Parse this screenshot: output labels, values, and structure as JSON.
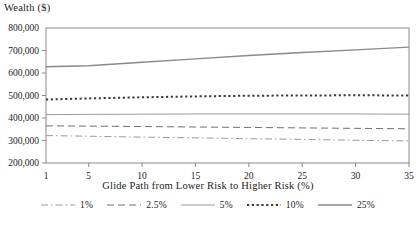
{
  "chart_data": {
    "type": "line",
    "title": "",
    "ylabel": "Wealth ($)",
    "xlabel": "Glide Path from Lower Risk to Higher Risk (%)",
    "grid": false,
    "legend_position": "bottom",
    "xlim": [
      1,
      35
    ],
    "ylim": [
      200000,
      800000
    ],
    "x_ticks": [
      1,
      5,
      10,
      15,
      20,
      25,
      30,
      35
    ],
    "x_tick_labels": [
      "1",
      "5",
      "10",
      "15",
      "20",
      "25",
      "30",
      "35"
    ],
    "y_ticks": [
      200000,
      300000,
      400000,
      500000,
      600000,
      700000,
      800000
    ],
    "y_tick_labels": [
      "200,000",
      "300,000",
      "400,000",
      "500,000",
      "600,000",
      "700,000",
      "800,000"
    ],
    "x": [
      1,
      5,
      10,
      15,
      20,
      25,
      30,
      35
    ],
    "series": [
      {
        "name": "1%",
        "style": "dashdot",
        "color": "#9a9a9a",
        "width": 1,
        "values": [
          322000,
          319000,
          315000,
          312000,
          308000,
          305000,
          301000,
          298000
        ]
      },
      {
        "name": "2.5%",
        "style": "dashed",
        "color": "#707070",
        "width": 1,
        "values": [
          365000,
          364000,
          362000,
          360000,
          358000,
          356000,
          354000,
          352000
        ]
      },
      {
        "name": "5%",
        "style": "solid",
        "color": "#9a9a9a",
        "width": 1,
        "values": [
          415000,
          416000,
          417000,
          418000,
          418000,
          418000,
          418000,
          417000
        ]
      },
      {
        "name": "10%",
        "style": "dotted",
        "color": "#3a3a3a",
        "width": 2,
        "values": [
          482000,
          487000,
          492000,
          496000,
          499000,
          500000,
          501000,
          500000
        ]
      },
      {
        "name": "25%",
        "style": "solid",
        "color": "#8a8a8a",
        "width": 1.4,
        "values": [
          628000,
          632000,
          648000,
          663000,
          678000,
          691000,
          703000,
          715000
        ]
      }
    ]
  },
  "legend": {
    "items": [
      {
        "label": "1%"
      },
      {
        "label": "2.5%"
      },
      {
        "label": "5%"
      },
      {
        "label": "10%"
      },
      {
        "label": "25%"
      }
    ]
  }
}
